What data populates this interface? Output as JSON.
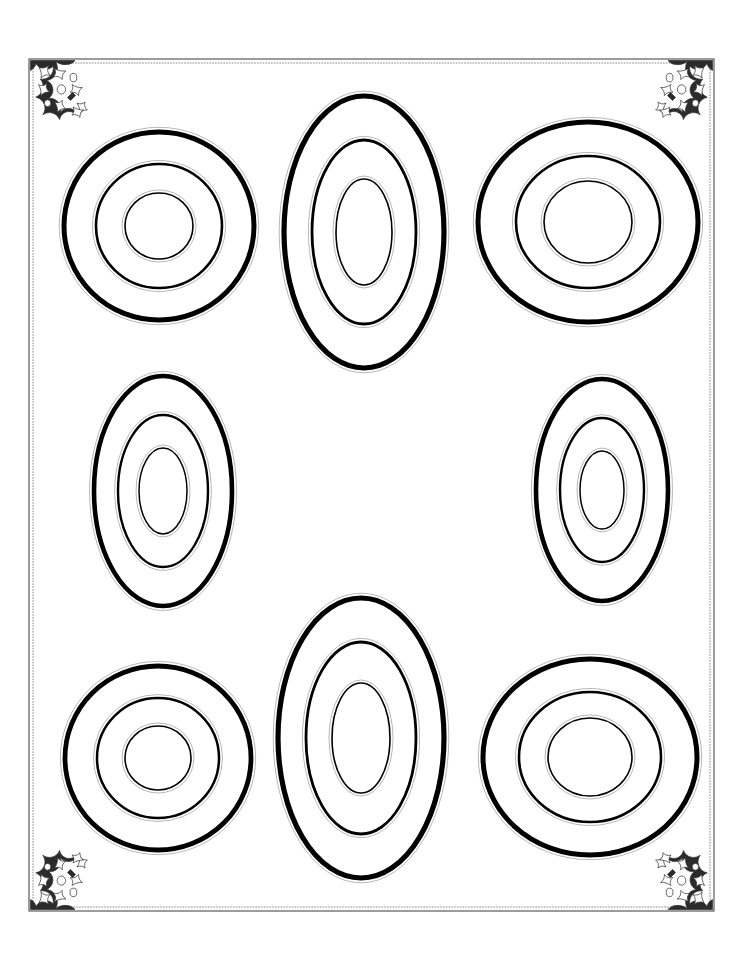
{
  "page": {
    "title": "Concentric Ovals Practice Sheet",
    "background_color": "#ffffff",
    "ink_color": "#000000",
    "width": 739,
    "height": 958
  },
  "frame": {
    "name": "ornamental-border",
    "style": "double-rule",
    "outer_rect": {
      "x": 29,
      "y": 59,
      "width": 685,
      "height": 852
    },
    "inner_rect": {
      "x": 33,
      "y": 63,
      "width": 677,
      "height": 844
    },
    "line_color": "#3a3a3a",
    "line_width": 1,
    "corner_ornaments": [
      {
        "label": "top-left-ornament",
        "position": "top-left"
      },
      {
        "label": "top-right-ornament",
        "position": "top-right"
      },
      {
        "label": "bottom-left-ornament",
        "position": "bottom-left"
      },
      {
        "label": "bottom-right-ornament",
        "position": "bottom-right"
      }
    ]
  },
  "figures": [
    {
      "id": "figure-1",
      "label": "top-left-target",
      "shape": "circle",
      "cx": 159,
      "cy": 226,
      "rings": [
        {
          "rx": 95,
          "ry": 94,
          "stroke": 5.0,
          "halo": true
        },
        {
          "rx": 63,
          "ry": 62,
          "stroke": 2.6,
          "halo": true
        },
        {
          "rx": 34,
          "ry": 33,
          "stroke": 1.6,
          "halo": true
        }
      ]
    },
    {
      "id": "figure-2",
      "label": "top-center-target",
      "shape": "oval",
      "cx": 364,
      "cy": 232,
      "rings": [
        {
          "rx": 80,
          "ry": 136,
          "stroke": 5.2,
          "halo": true
        },
        {
          "rx": 52,
          "ry": 92,
          "stroke": 2.8,
          "halo": true
        },
        {
          "rx": 28,
          "ry": 53,
          "stroke": 1.6,
          "halo": true
        }
      ]
    },
    {
      "id": "figure-3",
      "label": "top-right-target",
      "shape": "circle",
      "cx": 588,
      "cy": 222,
      "rings": [
        {
          "rx": 110,
          "ry": 100,
          "stroke": 5.0,
          "halo": true
        },
        {
          "rx": 72,
          "ry": 66,
          "stroke": 2.6,
          "halo": true
        },
        {
          "rx": 44,
          "ry": 41,
          "stroke": 1.6,
          "halo": true
        }
      ]
    },
    {
      "id": "figure-4",
      "label": "middle-left-target",
      "shape": "oval",
      "cx": 163,
      "cy": 491,
      "rings": [
        {
          "rx": 69,
          "ry": 115,
          "stroke": 4.6,
          "halo": true
        },
        {
          "rx": 45,
          "ry": 76,
          "stroke": 2.4,
          "halo": true
        },
        {
          "rx": 24,
          "ry": 43,
          "stroke": 1.5,
          "halo": true
        }
      ]
    },
    {
      "id": "figure-5",
      "label": "middle-right-target",
      "shape": "oval",
      "cx": 602,
      "cy": 490,
      "rings": [
        {
          "rx": 66,
          "ry": 111,
          "stroke": 4.6,
          "halo": true
        },
        {
          "rx": 42,
          "ry": 72,
          "stroke": 2.4,
          "halo": true
        },
        {
          "rx": 22,
          "ry": 39,
          "stroke": 1.5,
          "halo": true
        }
      ]
    },
    {
      "id": "figure-6",
      "label": "bottom-left-target",
      "shape": "circle",
      "cx": 158,
      "cy": 758,
      "rings": [
        {
          "rx": 93,
          "ry": 92,
          "stroke": 4.8,
          "halo": true
        },
        {
          "rx": 61,
          "ry": 60,
          "stroke": 2.5,
          "halo": true
        },
        {
          "rx": 33,
          "ry": 32,
          "stroke": 1.6,
          "halo": true
        }
      ]
    },
    {
      "id": "figure-7",
      "label": "bottom-center-target",
      "shape": "oval",
      "cx": 361,
      "cy": 738,
      "rings": [
        {
          "rx": 83,
          "ry": 140,
          "stroke": 5.2,
          "halo": true
        },
        {
          "rx": 55,
          "ry": 96,
          "stroke": 2.8,
          "halo": true
        },
        {
          "rx": 29,
          "ry": 55,
          "stroke": 1.6,
          "halo": true
        }
      ]
    },
    {
      "id": "figure-8",
      "label": "bottom-right-target",
      "shape": "circle",
      "cx": 590,
      "cy": 757,
      "rings": [
        {
          "rx": 107,
          "ry": 98,
          "stroke": 5.0,
          "halo": true
        },
        {
          "rx": 71,
          "ry": 65,
          "stroke": 2.6,
          "halo": true
        },
        {
          "rx": 42,
          "ry": 39,
          "stroke": 1.6,
          "halo": true
        }
      ]
    }
  ],
  "meta": {
    "figure_count": 8,
    "rings_per_figure": 3
  }
}
